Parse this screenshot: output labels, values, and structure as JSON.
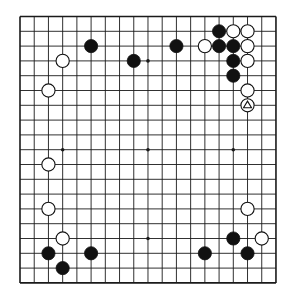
{
  "board": {
    "size": 19,
    "origin": {
      "x": 20,
      "y": 16.5
    },
    "spacing": {
      "x": 14.22,
      "y": 14.8
    },
    "line_color": "#1a1a1a",
    "background": "#ffffff",
    "hoshi": [
      [
        3,
        3
      ],
      [
        9,
        3
      ],
      [
        15,
        3
      ],
      [
        3,
        9
      ],
      [
        9,
        9
      ],
      [
        15,
        9
      ],
      [
        3,
        15
      ],
      [
        9,
        15
      ],
      [
        15,
        15
      ]
    ],
    "stones": [
      {
        "color": "black",
        "col": 5,
        "row": 2
      },
      {
        "color": "black",
        "col": 8,
        "row": 3
      },
      {
        "color": "black",
        "col": 11,
        "row": 2
      },
      {
        "color": "white",
        "col": 3,
        "row": 3
      },
      {
        "color": "white",
        "col": 2,
        "row": 5
      },
      {
        "color": "black",
        "col": 14,
        "row": 1
      },
      {
        "color": "white",
        "col": 15,
        "row": 1
      },
      {
        "color": "white",
        "col": 16,
        "row": 1
      },
      {
        "color": "white",
        "col": 13,
        "row": 2
      },
      {
        "color": "black",
        "col": 14,
        "row": 2
      },
      {
        "color": "black",
        "col": 15,
        "row": 2
      },
      {
        "color": "white",
        "col": 16,
        "row": 2
      },
      {
        "color": "black",
        "col": 15,
        "row": 3
      },
      {
        "color": "white",
        "col": 16,
        "row": 3
      },
      {
        "color": "black",
        "col": 15,
        "row": 4
      },
      {
        "color": "white",
        "col": 16,
        "row": 5
      },
      {
        "color": "white",
        "col": 16,
        "row": 6,
        "marker": "triangle"
      },
      {
        "color": "white",
        "col": 2,
        "row": 10
      },
      {
        "color": "white",
        "col": 2,
        "row": 13
      },
      {
        "color": "white",
        "col": 3,
        "row": 15
      },
      {
        "color": "black",
        "col": 2,
        "row": 16
      },
      {
        "color": "black",
        "col": 3,
        "row": 17
      },
      {
        "color": "black",
        "col": 5,
        "row": 16
      },
      {
        "color": "white",
        "col": 16,
        "row": 13
      },
      {
        "color": "black",
        "col": 15,
        "row": 15
      },
      {
        "color": "white",
        "col": 17,
        "row": 15
      },
      {
        "color": "black",
        "col": 13,
        "row": 16
      },
      {
        "color": "black",
        "col": 16,
        "row": 16
      }
    ]
  }
}
